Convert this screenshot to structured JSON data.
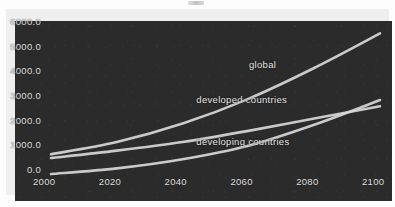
{
  "chart_data": {
    "type": "line",
    "title": "",
    "xlabel": "",
    "ylabel": "",
    "xlim": [
      2000,
      2100
    ],
    "ylim": [
      0,
      6000
    ],
    "grid": false,
    "legend_position": "inline-annotations",
    "x": [
      2000,
      2020,
      2040,
      2060,
      2080,
      2100
    ],
    "xtick_labels": [
      "2000",
      "2020",
      "2040",
      "2060",
      "2080",
      "2100"
    ],
    "ytick_labels": [
      "6000.0",
      "5000.0",
      "4000.0",
      "3000.0",
      "2000.0",
      "1000.0",
      "0.0"
    ],
    "ytick_values": [
      6000,
      5000,
      4000,
      3000,
      2000,
      1000,
      0
    ],
    "series": [
      {
        "name": "global",
        "label": "global",
        "color": "#d8d8d8",
        "values": [
          1000,
          1500,
          2250,
          3250,
          4500,
          5900
        ]
      },
      {
        "name": "developed countries",
        "label": "developed countries",
        "color": "#d8d8d8",
        "values": [
          850,
          1150,
          1500,
          1950,
          2450,
          2950
        ]
      },
      {
        "name": "developing countries",
        "label": "developing countries",
        "color": "#d8d8d8",
        "values": [
          200,
          430,
          800,
          1350,
          2200,
          3200
        ]
      }
    ],
    "annotations": [
      {
        "text": "global",
        "x": 2062,
        "y": 4250
      },
      {
        "text": "developed countries",
        "x": 2046,
        "y": 2820
      },
      {
        "text": "developing countries",
        "x": 2046,
        "y": 1130
      }
    ]
  },
  "figure": {
    "background_color": "#2b2b2b",
    "line_color": "#d8d8d8",
    "text_color": "#e2e2e2",
    "border_color": "#efefef"
  }
}
